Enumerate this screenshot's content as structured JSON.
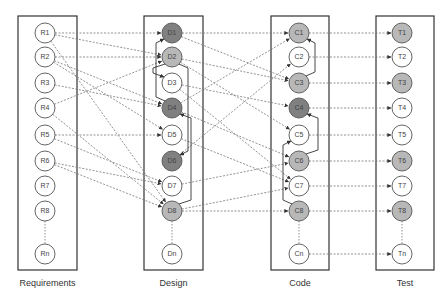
{
  "diagram": {
    "type": "traceability-diagram",
    "columns": [
      {
        "id": "req",
        "label": "Requirements",
        "x": 18,
        "w": 59,
        "cx": 45,
        "nodes": [
          {
            "id": "R1",
            "label": "R1",
            "fill": "white"
          },
          {
            "id": "R2",
            "label": "R2",
            "fill": "white"
          },
          {
            "id": "R3",
            "label": "R3",
            "fill": "white"
          },
          {
            "id": "R4",
            "label": "R4",
            "fill": "white"
          },
          {
            "id": "R5",
            "label": "R5",
            "fill": "white"
          },
          {
            "id": "R6",
            "label": "R6",
            "fill": "white"
          },
          {
            "id": "R7",
            "label": "R7",
            "fill": "white"
          },
          {
            "id": "R8",
            "label": "R8",
            "fill": "white"
          },
          {
            "id": "Rn",
            "label": "Rn",
            "fill": "white"
          }
        ]
      },
      {
        "id": "des",
        "label": "Design",
        "x": 144,
        "w": 59,
        "cx": 172,
        "nodes": [
          {
            "id": "D1",
            "label": "D1",
            "fill": "dark"
          },
          {
            "id": "D2",
            "label": "D2",
            "fill": "light"
          },
          {
            "id": "D3",
            "label": "D3",
            "fill": "white"
          },
          {
            "id": "D4",
            "label": "D4",
            "fill": "dark"
          },
          {
            "id": "D5",
            "label": "D5",
            "fill": "white"
          },
          {
            "id": "D6",
            "label": "D6",
            "fill": "dark"
          },
          {
            "id": "D7",
            "label": "D7",
            "fill": "white"
          },
          {
            "id": "D8",
            "label": "D8",
            "fill": "light"
          },
          {
            "id": "Dn",
            "label": "Dn",
            "fill": "white"
          }
        ]
      },
      {
        "id": "code",
        "label": "Code",
        "x": 271,
        "w": 58,
        "cx": 299,
        "nodes": [
          {
            "id": "C1",
            "label": "C1",
            "fill": "light"
          },
          {
            "id": "C2",
            "label": "C2",
            "fill": "white"
          },
          {
            "id": "C3",
            "label": "C3",
            "fill": "light"
          },
          {
            "id": "C4",
            "label": "C4",
            "fill": "dark"
          },
          {
            "id": "C5",
            "label": "C5",
            "fill": "white"
          },
          {
            "id": "C6",
            "label": "C6",
            "fill": "light"
          },
          {
            "id": "C7",
            "label": "C7",
            "fill": "white"
          },
          {
            "id": "C8",
            "label": "C8",
            "fill": "light"
          },
          {
            "id": "Cn",
            "label": "Cn",
            "fill": "white"
          }
        ]
      },
      {
        "id": "test",
        "label": "Test",
        "x": 376,
        "w": 58,
        "cx": 402,
        "nodes": [
          {
            "id": "T1",
            "label": "T1",
            "fill": "light"
          },
          {
            "id": "T2",
            "label": "T2",
            "fill": "white"
          },
          {
            "id": "T3",
            "label": "T3",
            "fill": "light"
          },
          {
            "id": "T4",
            "label": "T4",
            "fill": "white"
          },
          {
            "id": "T5",
            "label": "T5",
            "fill": "white"
          },
          {
            "id": "T6",
            "label": "T6",
            "fill": "light"
          },
          {
            "id": "T7",
            "label": "T7",
            "fill": "white"
          },
          {
            "id": "T8",
            "label": "T8",
            "fill": "light"
          },
          {
            "id": "Tn",
            "label": "Tn",
            "fill": "white"
          }
        ]
      }
    ],
    "row_y": [
      33,
      57,
      83,
      108,
      135,
      161,
      186,
      211,
      254
    ],
    "colors": {
      "white": "#ffffff",
      "light": "#b8b8b8",
      "dark": "#808080",
      "stroke": "#555555",
      "box": "#333333",
      "dashed": "#777777"
    },
    "trace_links": [
      [
        "R1",
        "D1"
      ],
      [
        "R1",
        "D2"
      ],
      [
        "R1",
        "D8"
      ],
      [
        "R2",
        "D2"
      ],
      [
        "R2",
        "D4"
      ],
      [
        "R2",
        "D5"
      ],
      [
        "R3",
        "D4"
      ],
      [
        "R4",
        "D2"
      ],
      [
        "R4",
        "D8"
      ],
      [
        "R5",
        "D5"
      ],
      [
        "R5",
        "D7"
      ],
      [
        "R6",
        "D7"
      ],
      [
        "R6",
        "D8"
      ],
      [
        "D1",
        "C1"
      ],
      [
        "D1",
        "C3"
      ],
      [
        "D2",
        "C3"
      ],
      [
        "D2",
        "C5"
      ],
      [
        "D3",
        "C4"
      ],
      [
        "D3",
        "C7"
      ],
      [
        "D4",
        "C1"
      ],
      [
        "D4",
        "C6"
      ],
      [
        "D5",
        "C7"
      ],
      [
        "D6",
        "C2"
      ],
      [
        "D7",
        "C6"
      ],
      [
        "D8",
        "C7"
      ],
      [
        "D8",
        "C8"
      ],
      [
        "C1",
        "T1"
      ],
      [
        "C2",
        "T2"
      ],
      [
        "C3",
        "T3"
      ],
      [
        "C4",
        "T4"
      ],
      [
        "C5",
        "T5"
      ],
      [
        "C6",
        "T6"
      ],
      [
        "C7",
        "T7"
      ],
      [
        "C8",
        "T8"
      ],
      [
        "Cn",
        "Tn"
      ]
    ],
    "internal_links": [
      {
        "col": "des",
        "from": "D4",
        "to": "D1"
      },
      {
        "col": "des",
        "from": "D2",
        "to": "D3"
      },
      {
        "col": "des",
        "from": "D2",
        "to": "D6"
      },
      {
        "col": "des",
        "from": "D8",
        "to": "D4"
      },
      {
        "col": "code",
        "from": "C3",
        "to": "C1"
      },
      {
        "col": "code",
        "from": "C6",
        "to": "C4"
      },
      {
        "col": "code",
        "from": "C8",
        "to": "C5"
      }
    ]
  }
}
